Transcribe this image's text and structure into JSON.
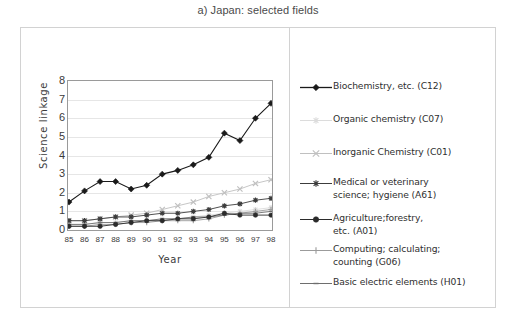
{
  "figure": {
    "title": "a) Japan: selected fields"
  },
  "axes": {
    "y_title": "Science linkage",
    "x_title": "Year",
    "y_ticks": [
      "0",
      "1",
      "2",
      "3",
      "4",
      "5",
      "6",
      "7",
      "8"
    ],
    "x_ticks": [
      "85",
      "86",
      "87",
      "88",
      "89",
      "90",
      "91",
      "92",
      "93",
      "94",
      "95",
      "96",
      "97",
      "98"
    ]
  },
  "legend": {
    "items": [
      {
        "label": "Biochemistry, etc. (C12)",
        "color": "#1a1a1a",
        "marker": "diamond"
      },
      {
        "label": "Organic chemistry (C07)",
        "color": "#dcdcdc",
        "marker": "star"
      },
      {
        "label": "Inorganic Chemistry (C01)",
        "color": "#c0c0c0",
        "marker": "cross-x"
      },
      {
        "label": "Medical or veterinary\nscience; hygiene (A61)",
        "color": "#3c3c3c",
        "marker": "asterisk"
      },
      {
        "label": "Agriculture;forestry,\netc. (A01)",
        "color": "#2b2b2b",
        "marker": "circle"
      },
      {
        "label": "Computing; calculating;\ncounting (G06)",
        "color": "#9b9b9b",
        "marker": "plus"
      },
      {
        "label": "Basic electric elements (H01)",
        "color": "#6e6e6e",
        "marker": "line"
      }
    ]
  },
  "chart_data": {
    "type": "line",
    "title": "a) Japan: selected fields",
    "xlabel": "Year",
    "ylabel": "Science linkage",
    "x": [
      "85",
      "86",
      "87",
      "88",
      "89",
      "90",
      "91",
      "92",
      "93",
      "94",
      "95",
      "96",
      "97",
      "98"
    ],
    "ylim": [
      0,
      8
    ],
    "xlim": [
      "85",
      "98"
    ],
    "grid": true,
    "legend_position": "right",
    "series": [
      {
        "name": "Biochemistry, etc. (C12)",
        "code": "C12",
        "color": "#1a1a1a",
        "marker": "diamond",
        "values": [
          1.5,
          2.1,
          2.6,
          2.6,
          2.2,
          2.4,
          3.0,
          3.2,
          3.5,
          3.9,
          5.2,
          4.8,
          6.0,
          6.8
        ]
      },
      {
        "name": "Organic chemistry (C07)",
        "code": "C07",
        "color": "#dcdcdc",
        "marker": "star",
        "values": [
          0.3,
          0.3,
          0.4,
          0.4,
          0.5,
          0.5,
          0.6,
          0.6,
          0.7,
          0.8,
          0.9,
          1.0,
          1.1,
          1.2
        ]
      },
      {
        "name": "Inorganic Chemistry (C01)",
        "code": "C01",
        "color": "#c0c0c0",
        "marker": "cross-x",
        "values": [
          0.5,
          0.5,
          0.6,
          0.7,
          0.8,
          0.9,
          1.1,
          1.3,
          1.5,
          1.8,
          2.0,
          2.2,
          2.5,
          2.7
        ]
      },
      {
        "name": "Medical or veterinary science; hygiene (A61)",
        "code": "A61",
        "color": "#3c3c3c",
        "marker": "asterisk",
        "values": [
          0.5,
          0.5,
          0.6,
          0.7,
          0.7,
          0.8,
          0.9,
          0.9,
          1.0,
          1.1,
          1.3,
          1.4,
          1.6,
          1.7
        ]
      },
      {
        "name": "Agriculture;forestry, etc. (A01)",
        "code": "A01",
        "color": "#2b2b2b",
        "marker": "circle",
        "values": [
          0.2,
          0.2,
          0.2,
          0.3,
          0.4,
          0.5,
          0.5,
          0.6,
          0.6,
          0.7,
          0.9,
          0.8,
          0.8,
          0.8
        ]
      },
      {
        "name": "Computing; calculating; counting (G06)",
        "code": "G06",
        "color": "#9b9b9b",
        "marker": "plus",
        "values": [
          0.2,
          0.2,
          0.3,
          0.3,
          0.4,
          0.4,
          0.5,
          0.5,
          0.5,
          0.6,
          0.8,
          0.9,
          1.0,
          1.1
        ]
      },
      {
        "name": "Basic electric elements (H01)",
        "code": "H01",
        "color": "#6e6e6e",
        "marker": "line",
        "values": [
          0.3,
          0.3,
          0.4,
          0.4,
          0.5,
          0.5,
          0.6,
          0.6,
          0.7,
          0.7,
          0.8,
          0.9,
          0.9,
          1.0
        ]
      }
    ]
  }
}
